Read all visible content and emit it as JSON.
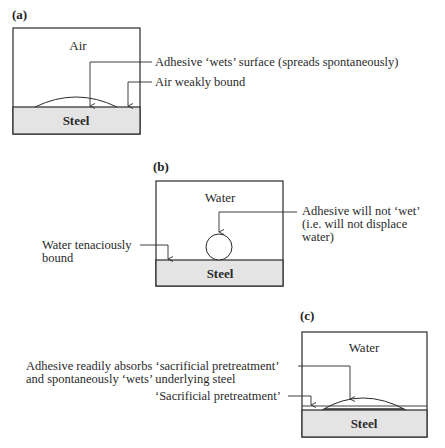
{
  "panels": {
    "a": {
      "label": "(a)",
      "medium": "Air",
      "substrate": "Steel",
      "callouts": [
        "Adhesive ‘wets’ surface (spreads spontaneously)",
        "Air weakly bound"
      ]
    },
    "b": {
      "label": "(b)",
      "medium": "Water",
      "substrate": "Steel",
      "callouts": {
        "adhesive_lines": [
          "Adhesive will not ‘wet’",
          "(i.e. will not displace",
          "water)"
        ],
        "water_lines": [
          "Water tenaciously",
          "bound"
        ]
      }
    },
    "c": {
      "label": "(c)",
      "medium": "Water",
      "substrate": "Steel",
      "callouts": {
        "adhesive_lines": [
          "Adhesive readily absorbs ‘sacrificial pretreatment’",
          "and spontaneously ‘wets’ underlying steel"
        ],
        "pretreatment": "‘Sacrificial pretreatment’"
      }
    }
  },
  "colors": {
    "steel_fill": "#e4e4e4",
    "line": "#2a2a2a",
    "background": "#ffffff"
  }
}
